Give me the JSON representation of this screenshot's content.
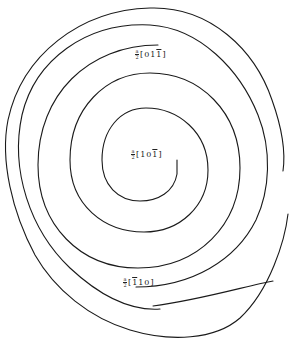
{
  "diagram": {
    "type": "spiral",
    "stroke_color": "#1a1a1a",
    "background": "#ffffff",
    "labels": [
      {
        "id": "top",
        "prefix_num": "a",
        "prefix_den": "2",
        "open": "[",
        "digits": [
          "0",
          "1",
          "1"
        ],
        "overbar_index": 2,
        "close": "]",
        "text": "a/2[01-1]"
      },
      {
        "id": "center",
        "prefix_num": "a",
        "prefix_den": "2",
        "open": "[",
        "digits": [
          "1",
          "0",
          "1"
        ],
        "overbar_index": 2,
        "close": "]",
        "text": "a/2[10-1]"
      },
      {
        "id": "bottom",
        "prefix_num": "a",
        "prefix_den": "2",
        "open": "[",
        "digits": [
          "1",
          "1",
          "0"
        ],
        "overbar_index": 0,
        "close": "]",
        "text": "a/2[-110]"
      }
    ]
  }
}
